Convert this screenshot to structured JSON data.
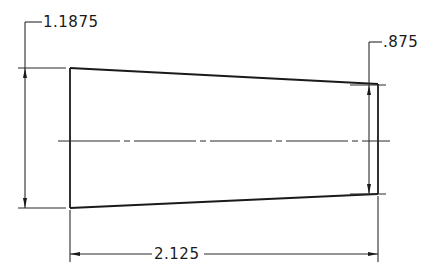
{
  "drawing": {
    "title": "Tapered part dimension drawing",
    "colors": {
      "line": "#1a1a1a",
      "background": "#ffffff"
    },
    "dimensions": {
      "left_height": {
        "label": "1.1875"
      },
      "right_height": {
        "label": ".875"
      },
      "length": {
        "label": "2.125"
      }
    },
    "features": {
      "centerline": "center-line",
      "outline": "tapered-trapezoid"
    }
  }
}
